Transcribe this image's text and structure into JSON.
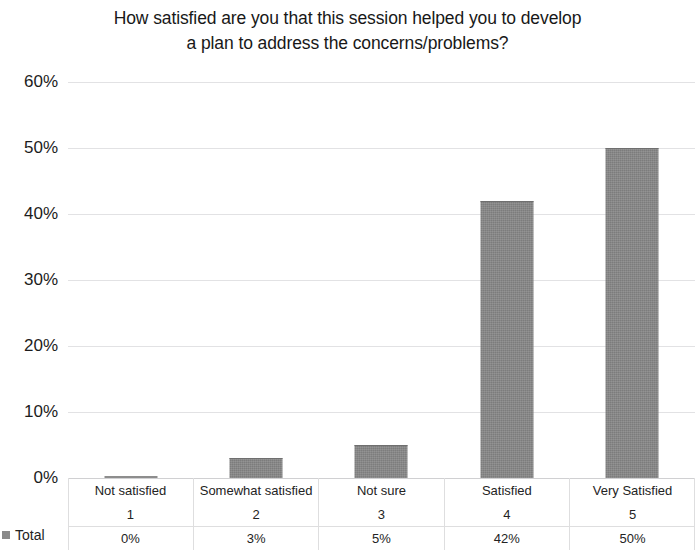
{
  "chart_data": {
    "type": "bar",
    "title": "How satisfied are you that this session helped you to develop a plan to address the concerns/problems?",
    "title_line1": "How satisfied are you that this session helped you to develop",
    "title_line2": "a plan to address the concerns/problems?",
    "categories": [
      "Not satisfied",
      "Somewhat satisfied",
      "Not sure",
      "Satisfied",
      "Very Satisfied"
    ],
    "category_numbers": [
      "1",
      "2",
      "3",
      "4",
      "5"
    ],
    "values": [
      0,
      3,
      5,
      42,
      50
    ],
    "value_labels": [
      "0%",
      "3%",
      "5%",
      "42%",
      "50%"
    ],
    "series": [
      {
        "name": "Total",
        "values": [
          0,
          3,
          5,
          42,
          50
        ],
        "color": "#878787"
      }
    ],
    "xlabel": "",
    "ylabel": "",
    "ylim": [
      0,
      60
    ],
    "ytick_labels": [
      "60%",
      "50%",
      "40%",
      "30%",
      "20%",
      "10%",
      "0%"
    ],
    "ytick_values": [
      60,
      50,
      40,
      30,
      20,
      10,
      0
    ],
    "grid": true,
    "legend_position": "bottom-left",
    "legend_entries": [
      "Total"
    ],
    "bar_color": "#878787",
    "gridline_color": "#e2e2e4"
  },
  "table": {
    "row_category_label": "",
    "row_number_label": "",
    "row_total_label": "Total",
    "columns": [
      {
        "category": "Not satisfied",
        "number": "1",
        "total": "0%"
      },
      {
        "category": "Somewhat satisfied",
        "number": "2",
        "total": "3%"
      },
      {
        "category": "Not sure",
        "number": "3",
        "total": "5%"
      },
      {
        "category": "Satisfied",
        "number": "4",
        "total": "42%"
      },
      {
        "category": "Very Satisfied",
        "number": "5",
        "total": "50%"
      }
    ]
  }
}
